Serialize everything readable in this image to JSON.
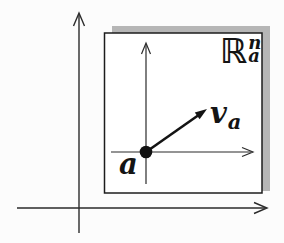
{
  "figure": {
    "labels": {
      "point": "a",
      "vector_main": "v",
      "vector_sub": "a",
      "space_main": "ℝ",
      "space_sup": "n",
      "space_sub": "a"
    },
    "colors": {
      "ink": "#2b2b2b",
      "box_border": "#1c1c1c",
      "box_fill": "#ffffff",
      "shadow": "#b6b6b6",
      "background": "#fcfcfc"
    }
  }
}
